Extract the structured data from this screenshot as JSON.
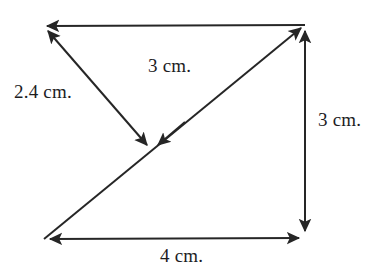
{
  "figure": {
    "kind": "geometry-diagram",
    "stroke_color": "#262626",
    "background_color": "#ffffff",
    "stroke_width": 2,
    "labels": {
      "left_slant": "2.4 cm.",
      "diagonal": "3 cm.",
      "right_side": "3 cm.",
      "bottom": "4 cm."
    },
    "vertices": {
      "top_left": {
        "x": 44,
        "y": 26
      },
      "top_right": {
        "x": 305,
        "y": 25
      },
      "bottom_left": {
        "x": 44,
        "y": 239
      },
      "bottom_right": {
        "x": 305,
        "y": 237
      },
      "center": {
        "x": 152,
        "y": 150
      }
    },
    "segments": [
      {
        "name": "top-edge",
        "from": "top_left",
        "to": "top_right",
        "arrow_start": true,
        "arrow_end": false,
        "label": null
      },
      {
        "name": "right-edge",
        "from": "top_right",
        "to": "bottom_right",
        "arrow_start": true,
        "arrow_end": true,
        "label": "3 cm."
      },
      {
        "name": "bottom-edge",
        "from": "bottom_left",
        "to": "bottom_right",
        "arrow_start": true,
        "arrow_end": true,
        "label": "4 cm."
      },
      {
        "name": "left-slant-segment",
        "from": "top_left",
        "to": "center",
        "arrow_start": true,
        "arrow_end": true,
        "label": "2.4 cm."
      },
      {
        "name": "diagonal-segment",
        "from": "bottom_left",
        "to": "top_right",
        "arrow_start": false,
        "arrow_end": true,
        "mid_arrow_at_center": true,
        "label": "3 cm."
      }
    ]
  }
}
